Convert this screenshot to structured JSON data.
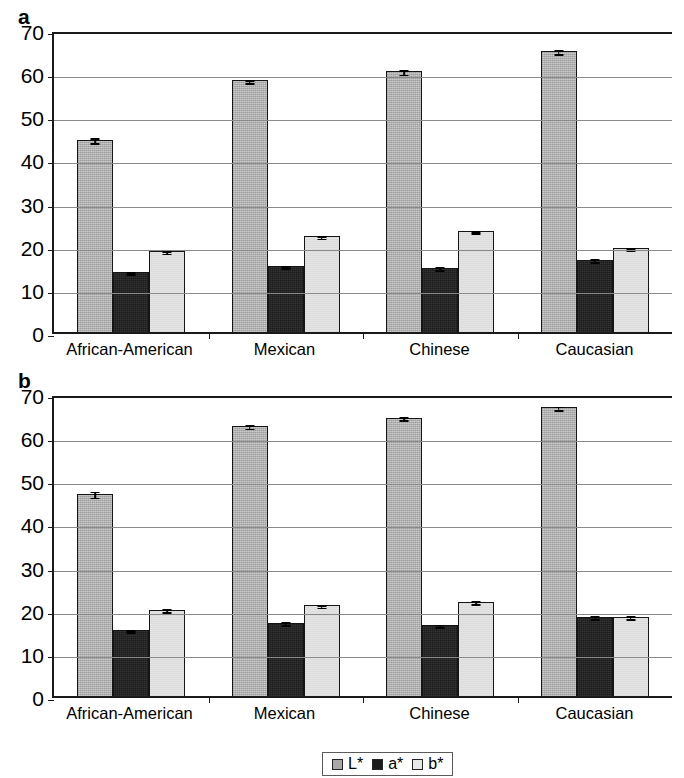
{
  "figure": {
    "panels": [
      {
        "letter": "a"
      },
      {
        "letter": "b"
      }
    ]
  },
  "legend": {
    "position": "bottom-center",
    "entries": [
      {
        "key": "L",
        "label": "L*",
        "color": "#a8a8a8"
      },
      {
        "key": "a",
        "label": "a*",
        "color": "#1b1b1b"
      },
      {
        "key": "b",
        "label": "b*",
        "color": "#e8e8e8"
      }
    ]
  },
  "axis": {
    "ticks": [
      "70",
      "60",
      "50",
      "40",
      "30",
      "20",
      "10",
      "0"
    ],
    "ymin": 0,
    "ymax": 70,
    "ystep": 10
  },
  "chart_data": [
    {
      "type": "bar",
      "panel": "a",
      "title": "",
      "xlabel": "",
      "ylabel": "",
      "ylim": [
        0,
        70
      ],
      "ystep": 10,
      "grid": true,
      "legend_position": "bottom-center",
      "categories": [
        "African-American",
        "Mexican",
        "Chinese",
        "Caucasian"
      ],
      "series": [
        {
          "name": "L*",
          "values": [
            44.6,
            58.3,
            60.4,
            65.1
          ],
          "errors": [
            0.6,
            0.4,
            0.5,
            0.4
          ]
        },
        {
          "name": "a*",
          "values": [
            13.9,
            15.3,
            14.9,
            16.8
          ],
          "errors": [
            0.3,
            0.3,
            0.3,
            0.3
          ]
        },
        {
          "name": "b*",
          "values": [
            18.7,
            22.2,
            23.4,
            19.4
          ],
          "errors": [
            0.3,
            0.3,
            0.3,
            0.3
          ]
        }
      ]
    },
    {
      "type": "bar",
      "panel": "b",
      "title": "",
      "xlabel": "",
      "ylabel": "",
      "ylim": [
        0,
        70
      ],
      "ystep": 10,
      "grid": true,
      "legend_position": "bottom-center",
      "categories": [
        "African-American",
        "Mexican",
        "Chinese",
        "Caucasian"
      ],
      "series": [
        {
          "name": "L*",
          "values": [
            46.9,
            62.6,
            64.5,
            66.9
          ],
          "errors": [
            0.7,
            0.4,
            0.4,
            0.4
          ]
        },
        {
          "name": "a*",
          "values": [
            15.3,
            17.0,
            16.5,
            18.4
          ],
          "errors": [
            0.3,
            0.3,
            0.3,
            0.3
          ]
        },
        {
          "name": "b*",
          "values": [
            20.0,
            21.0,
            21.9,
            18.4
          ],
          "errors": [
            0.3,
            0.3,
            0.3,
            0.3
          ]
        }
      ]
    }
  ]
}
